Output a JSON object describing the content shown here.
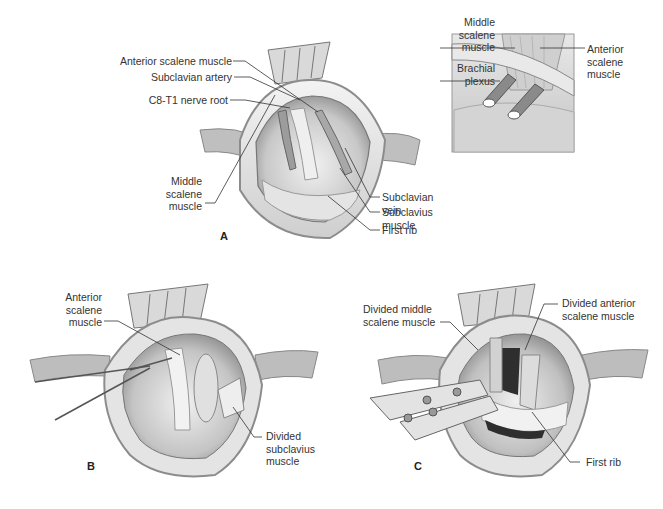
{
  "figure": {
    "panels": [
      {
        "id": "A",
        "letter": "A",
        "labels": [
          {
            "text": "Anterior scalene muscle"
          },
          {
            "text": "Subclavian artery"
          },
          {
            "text": "C8-T1 nerve root"
          },
          {
            "text": "Middle\nscalene\nmuscle"
          },
          {
            "text": "Subclavian vein"
          },
          {
            "text": "Subclavius muscle"
          },
          {
            "text": "First rib"
          }
        ]
      },
      {
        "id": "inset",
        "labels": [
          {
            "text": "Middle\nscalene\nmuscle"
          },
          {
            "text": "Brachial\nplexus"
          },
          {
            "text": "Anterior\nscalene\nmuscle"
          }
        ]
      },
      {
        "id": "B",
        "letter": "B",
        "labels": [
          {
            "text": "Anterior\nscalene\nmuscle"
          },
          {
            "text": "Divided\nsubclavius\nmuscle"
          }
        ]
      },
      {
        "id": "C",
        "letter": "C",
        "labels": [
          {
            "text": "Divided middle\nscalene muscle"
          },
          {
            "text": "Divided anterior\nscalene muscle"
          },
          {
            "text": "First rib"
          }
        ]
      }
    ],
    "colors": {
      "background": "#ffffff",
      "tissue_light": "#e6e6e6",
      "tissue_mid": "#bdbdbd",
      "tissue_dark": "#7a7a7a",
      "line": "#333333"
    }
  }
}
